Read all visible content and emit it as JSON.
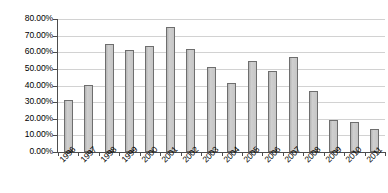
{
  "chart_data": {
    "type": "bar",
    "title": "",
    "subtitle": "",
    "xlabel": "",
    "ylabel": "",
    "categories": [
      "1996",
      "1997",
      "1998",
      "1999",
      "2000",
      "2001",
      "2002",
      "2003",
      "2004",
      "2005",
      "2006",
      "2007",
      "2008",
      "2009",
      "2010",
      "2011"
    ],
    "values": [
      31.0,
      40.5,
      65.0,
      61.5,
      64.0,
      75.0,
      62.0,
      51.0,
      41.5,
      54.5,
      49.0,
      57.0,
      37.0,
      19.0,
      18.0,
      14.0
    ],
    "value_labels": [
      "31.00%",
      "40.50%",
      "65.00%",
      "61.50%",
      "64.00%",
      "75.00%",
      "62.00%",
      "51.00%",
      "41.50%",
      "54.50%",
      "49.00%",
      "57.00%",
      "37.00%",
      "19.00%",
      "18.00%",
      "14.00%"
    ],
    "ylim": [
      0,
      80
    ],
    "ytick_values": [
      0,
      10,
      20,
      30,
      40,
      50,
      60,
      70,
      80
    ],
    "ytick_labels": [
      "0.00%",
      "10.00%",
      "20.00%",
      "30.00%",
      "40.00%",
      "50.00%",
      "60.00%",
      "70.00%",
      "80.00%"
    ],
    "grid": true,
    "grid_axis": "y",
    "legend": false,
    "legend_position": "none",
    "series": [
      {
        "name": "Series 1",
        "values": [
          31.0,
          40.5,
          65.0,
          61.5,
          64.0,
          75.0,
          62.0,
          51.0,
          41.5,
          54.5,
          49.0,
          57.0,
          37.0,
          19.0,
          18.0,
          14.0
        ],
        "color": "#c4c4c4",
        "border_color": "#6e6e6e"
      }
    ],
    "xtick_label_rotation": -45,
    "colors": {
      "bar_fill": "#c4c4c4",
      "bar_border": "#6e6e6e",
      "gridline": "#d2d2d2",
      "axis": "#4d4d4d",
      "text": "#000000",
      "background": "#ffffff"
    }
  }
}
